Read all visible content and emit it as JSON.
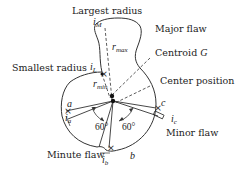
{
  "diagram": {
    "labels": {
      "largest_radius": "Largest radius",
      "smallest_radius": "Smallest radius",
      "major_flaw": "Major flaw",
      "centroid": "Centroid ",
      "centroid_symbol": "G",
      "center_position": "Center position",
      "minor_flaw": "Minor flaw",
      "minute_flaw": "Minute flaw"
    },
    "points": {
      "iM": {
        "base": "i",
        "sub": "M"
      },
      "iL": {
        "base": "i",
        "sub": "L"
      },
      "ia": {
        "base": "i",
        "sub": "a"
      },
      "ib": {
        "base": "i",
        "sub": "b"
      },
      "ic": {
        "base": "i",
        "sub": "c"
      },
      "a": "a",
      "b": "b",
      "c": "c"
    },
    "radii": {
      "rmax": {
        "base": "r",
        "sub": "max"
      },
      "rmin": {
        "base": "r",
        "sub": "min"
      }
    },
    "angles": {
      "left": "60°",
      "right": "60°"
    },
    "colors": {
      "stroke": "#333333",
      "text": "#222222",
      "background": "#ffffff"
    }
  }
}
